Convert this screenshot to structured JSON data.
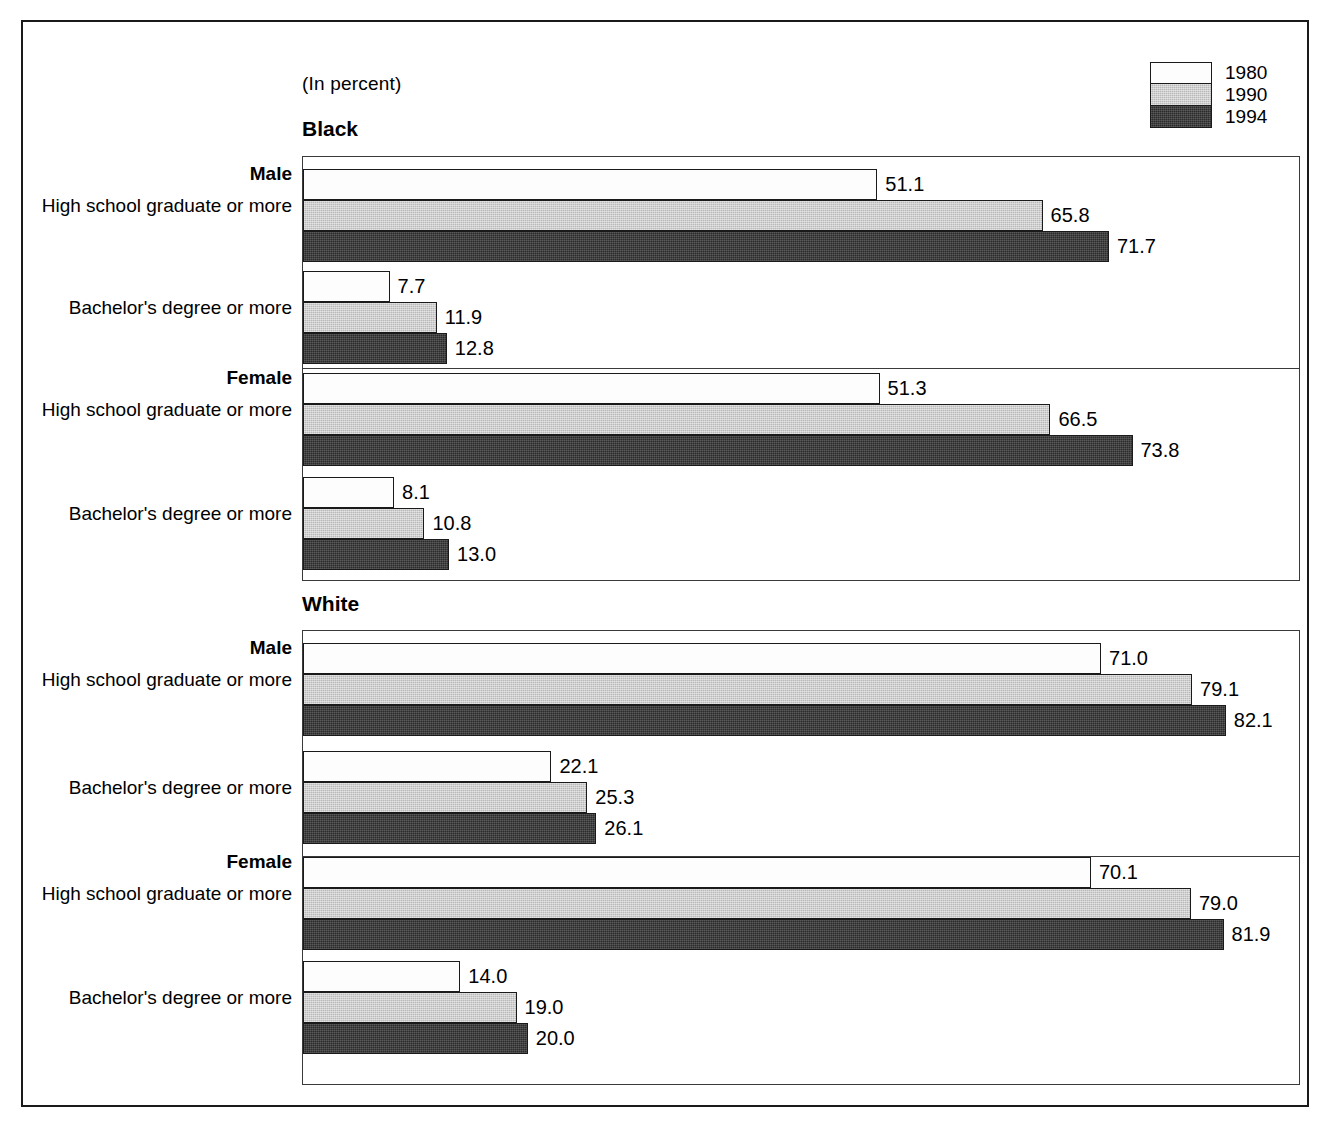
{
  "units_note": "(In percent)",
  "legend": {
    "items": [
      {
        "label": "1980",
        "swatch": "white-swatch",
        "color": "#fdfdfd"
      },
      {
        "label": "1990",
        "swatch": "light-gray-swatch",
        "color": "#b9b9b9"
      },
      {
        "label": "1994",
        "swatch": "dark-gray-swatch",
        "color": "#2b2b2b"
      }
    ]
  },
  "axis": {
    "max": 90,
    "start_px": 302,
    "px_per_unit": 11.24
  },
  "chart_data": {
    "type": "bar",
    "orientation": "horizontal",
    "title": "",
    "subtitle": "(In percent)",
    "xlabel": "",
    "ylabel": "",
    "xlim": [
      0,
      90
    ],
    "grid": false,
    "legend_position": "top-right",
    "series": [
      {
        "name": "1980",
        "values": [
          51.1,
          7.7,
          51.3,
          8.1,
          71.0,
          22.1,
          70.1,
          14.0
        ]
      },
      {
        "name": "1990",
        "values": [
          65.8,
          11.9,
          66.5,
          10.8,
          79.1,
          25.3,
          79.0,
          19.0
        ]
      },
      {
        "name": "1994",
        "values": [
          71.7,
          12.8,
          73.8,
          13.0,
          82.1,
          26.1,
          81.9,
          20.0
        ]
      }
    ],
    "categories": [
      "Black / Male / High school graduate or more",
      "Black / Male / Bachelor's degree or more",
      "Black / Female / High school graduate or more",
      "Black / Female / Bachelor's degree or more",
      "White / Male / High school graduate or more",
      "White / Male / Bachelor's degree or more",
      "White / Female / High school graduate or more",
      "White / Female / Bachelor's degree or more"
    ]
  },
  "sections": [
    {
      "race": "Black",
      "panels": [
        {
          "sex": "Male",
          "groups": [
            {
              "attainment": "High school graduate or more",
              "bars": [
                {
                  "year": "1980",
                  "value": 51.1,
                  "label": "51.1",
                  "cls": "fill-1980"
                },
                {
                  "year": "1990",
                  "value": 65.8,
                  "label": "65.8",
                  "cls": "fill-1990"
                },
                {
                  "year": "1994",
                  "value": 71.7,
                  "label": "71.7",
                  "cls": "fill-1994"
                }
              ]
            },
            {
              "attainment": "Bachelor's degree or more",
              "bars": [
                {
                  "year": "1980",
                  "value": 7.7,
                  "label": "7.7",
                  "cls": "fill-1980"
                },
                {
                  "year": "1990",
                  "value": 11.9,
                  "label": "11.9",
                  "cls": "fill-1990"
                },
                {
                  "year": "1994",
                  "value": 12.8,
                  "label": "12.8",
                  "cls": "fill-1994"
                }
              ]
            }
          ]
        },
        {
          "sex": "Female",
          "groups": [
            {
              "attainment": "High school graduate or more",
              "bars": [
                {
                  "year": "1980",
                  "value": 51.3,
                  "label": "51.3",
                  "cls": "fill-1980"
                },
                {
                  "year": "1990",
                  "value": 66.5,
                  "label": "66.5",
                  "cls": "fill-1990"
                },
                {
                  "year": "1994",
                  "value": 73.8,
                  "label": "73.8",
                  "cls": "fill-1994"
                }
              ]
            },
            {
              "attainment": "Bachelor's degree or more",
              "bars": [
                {
                  "year": "1980",
                  "value": 8.1,
                  "label": "8.1",
                  "cls": "fill-1980"
                },
                {
                  "year": "1990",
                  "value": 10.8,
                  "label": "10.8",
                  "cls": "fill-1990"
                },
                {
                  "year": "1994",
                  "value": 13.0,
                  "label": "13.0",
                  "cls": "fill-1994"
                }
              ]
            }
          ]
        }
      ]
    },
    {
      "race": "White",
      "panels": [
        {
          "sex": "Male",
          "groups": [
            {
              "attainment": "High school graduate or more",
              "bars": [
                {
                  "year": "1980",
                  "value": 71.0,
                  "label": "71.0",
                  "cls": "fill-1980"
                },
                {
                  "year": "1990",
                  "value": 79.1,
                  "label": "79.1",
                  "cls": "fill-1990"
                },
                {
                  "year": "1994",
                  "value": 82.1,
                  "label": "82.1",
                  "cls": "fill-1994"
                }
              ]
            },
            {
              "attainment": "Bachelor's degree or more",
              "bars": [
                {
                  "year": "1980",
                  "value": 22.1,
                  "label": "22.1",
                  "cls": "fill-1980"
                },
                {
                  "year": "1990",
                  "value": 25.3,
                  "label": "25.3",
                  "cls": "fill-1990"
                },
                {
                  "year": "1994",
                  "value": 26.1,
                  "label": "26.1",
                  "cls": "fill-1994"
                }
              ]
            }
          ]
        },
        {
          "sex": "Female",
          "groups": [
            {
              "attainment": "High school graduate or more",
              "bars": [
                {
                  "year": "1980",
                  "value": 70.1,
                  "label": "70.1",
                  "cls": "fill-1980"
                },
                {
                  "year": "1990",
                  "value": 79.0,
                  "label": "79.0",
                  "cls": "fill-1990"
                },
                {
                  "year": "1994",
                  "value": 81.9,
                  "label": "81.9",
                  "cls": "fill-1994"
                }
              ]
            },
            {
              "attainment": "Bachelor's degree or more",
              "bars": [
                {
                  "year": "1980",
                  "value": 14.0,
                  "label": "14.0",
                  "cls": "fill-1980"
                },
                {
                  "year": "1990",
                  "value": 19.0,
                  "label": "19.0",
                  "cls": "fill-1990"
                },
                {
                  "year": "1994",
                  "value": 20.0,
                  "label": "20.0",
                  "cls": "fill-1994"
                }
              ]
            }
          ]
        }
      ]
    }
  ]
}
